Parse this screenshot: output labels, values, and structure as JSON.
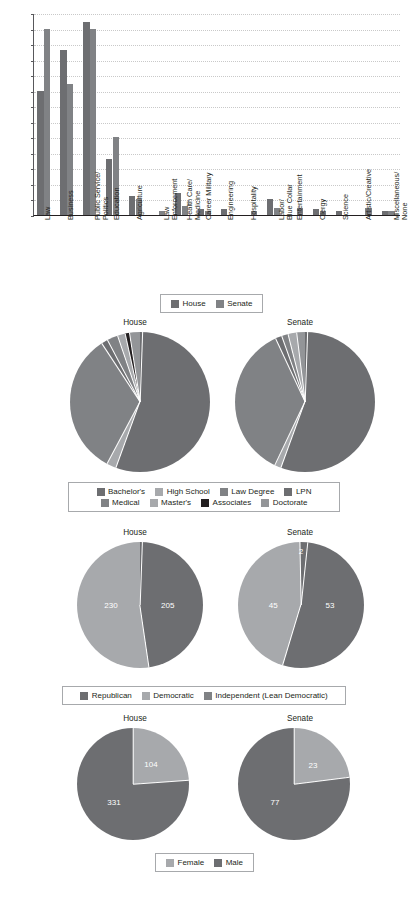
{
  "page": {
    "title_partial": "",
    "background": "#ffffff"
  },
  "colors": {
    "house": "#6d6e71",
    "senate": "#808285",
    "bachelors": "#6d6e71",
    "high_school": "#a7a9ac",
    "law_degree": "#808285",
    "lpn": "#6d6e71",
    "medical": "#808285",
    "masters": "#a7a9ac",
    "associates": "#231f20",
    "doctorate": "#939598",
    "republican": "#6d6e71",
    "democratic": "#a7a9ac",
    "independent": "#808285",
    "female": "#a7a9ac",
    "male": "#6d6e71",
    "axis": "#231f20",
    "grid": "#c9c9c9",
    "legend_border": "#a7a9ac"
  },
  "chart_data": [
    {
      "id": "occupation-bar",
      "type": "bar",
      "title": "",
      "xlabel": "",
      "ylabel": "",
      "ylim": [
        0,
        65
      ],
      "ytick_labels": [
        "65%",
        "60%",
        "55%",
        "50%",
        "45%",
        "40%",
        "35%",
        "30%",
        "25%",
        "20%",
        "15%",
        "10%",
        "5%",
        "0%"
      ],
      "ytick_values": [
        65,
        60,
        55,
        50,
        45,
        40,
        35,
        30,
        25,
        20,
        15,
        10,
        5,
        0
      ],
      "grid": true,
      "legend_position": "bottom",
      "categories": [
        "Law",
        "Business",
        "Public Service/ Politics",
        "Education",
        "Agriculture",
        "Law Enforcement",
        "Health Care/ Medicine",
        "Career Military",
        "Engineering",
        "Hospitality",
        "Labor/ Blue Collar",
        "Entertainment",
        "Clergy",
        "Science",
        "Artistic/Creative",
        "Miscellaneous/ None"
      ],
      "category_lines": [
        [
          "Law"
        ],
        [
          "Business"
        ],
        [
          "Public Service/",
          "Politics"
        ],
        [
          "Education"
        ],
        [
          "Agriculture"
        ],
        [
          "Law",
          "Enforcement"
        ],
        [
          "Health Care/",
          "Medicine"
        ],
        [
          "Career Military"
        ],
        [
          "Engineering"
        ],
        [
          "Hospitality"
        ],
        [
          "Labor/",
          "Blue Collar"
        ],
        [
          "Entertainment"
        ],
        [
          "Clergy"
        ],
        [
          "Science"
        ],
        [
          "Artistic/Creative"
        ],
        [
          "Miscellaneous/",
          "None"
        ]
      ],
      "series": [
        {
          "name": "House",
          "values": [
            40,
            53,
            62,
            18,
            6,
            0,
            7,
            2,
            2,
            0,
            5.3,
            0,
            2,
            1.3,
            0,
            1.2
          ]
        },
        {
          "name": "Senate",
          "values": [
            60,
            42,
            60,
            25,
            5,
            1.2,
            3,
            1.2,
            0,
            1.2,
            2.3,
            2.2,
            1.2,
            0,
            2.2,
            1.2
          ]
        }
      ]
    },
    {
      "id": "education-house",
      "type": "pie",
      "title": "House",
      "categories": [
        "Bachelor's",
        "High School",
        "Law Degree",
        "LPN",
        "Medical",
        "Master's",
        "Associates",
        "Doctorate"
      ],
      "values": [
        55,
        2.2,
        33,
        1.5,
        2.5,
        1.8,
        1.0,
        3.0
      ],
      "legend_position": "bottom"
    },
    {
      "id": "education-senate",
      "type": "pie",
      "title": "Senate",
      "categories": [
        "Bachelor's",
        "High School",
        "Law Degree",
        "LPN",
        "Medical",
        "Master's",
        "Associates",
        "Doctorate"
      ],
      "values": [
        55,
        1.5,
        36,
        1.5,
        1.5,
        2.0,
        0,
        2.5
      ],
      "legend_position": "bottom"
    },
    {
      "id": "party-house",
      "type": "pie",
      "title": "House",
      "categories": [
        "Republican",
        "Democratic",
        "Independent (Lean Democratic)"
      ],
      "values": [
        205,
        230,
        0
      ],
      "data_labels": [
        "205",
        "230"
      ],
      "legend_position": "bottom"
    },
    {
      "id": "party-senate",
      "type": "pie",
      "title": "Senate",
      "categories": [
        "Republican",
        "Democratic",
        "Independent (Lean Democratic)"
      ],
      "values": [
        53,
        45,
        2
      ],
      "data_labels": [
        "53",
        "45",
        "2"
      ],
      "legend_position": "bottom"
    },
    {
      "id": "gender-house",
      "type": "pie",
      "title": "House",
      "categories": [
        "Female",
        "Male"
      ],
      "values": [
        104,
        331
      ],
      "data_labels": [
        "104",
        "331"
      ],
      "legend_position": "bottom"
    },
    {
      "id": "gender-senate",
      "type": "pie",
      "title": "Senate",
      "categories": [
        "Female",
        "Male"
      ],
      "values": [
        23,
        77
      ],
      "data_labels": [
        "23",
        "77"
      ],
      "legend_position": "bottom"
    }
  ],
  "legends": {
    "chamber": {
      "items": [
        {
          "label": "House",
          "color": "#6d6e71"
        },
        {
          "label": "Senate",
          "color": "#808285"
        }
      ]
    },
    "education": {
      "items": [
        {
          "label": "Bachelor's",
          "color": "#6d6e71"
        },
        {
          "label": "High School",
          "color": "#a7a9ac"
        },
        {
          "label": "Law Degree",
          "color": "#808285"
        },
        {
          "label": "LPN",
          "color": "#6d6e71"
        },
        {
          "label": "Medical",
          "color": "#808285"
        },
        {
          "label": "Master's",
          "color": "#a7a9ac"
        },
        {
          "label": "Associates",
          "color": "#231f20"
        },
        {
          "label": "Doctorate",
          "color": "#939598"
        }
      ]
    },
    "party": {
      "items": [
        {
          "label": "Republican",
          "color": "#6d6e71"
        },
        {
          "label": "Democratic",
          "color": "#a7a9ac"
        },
        {
          "label": "Independent (Lean Democratic)",
          "color": "#808285"
        }
      ]
    },
    "gender": {
      "items": [
        {
          "label": "Female",
          "color": "#a7a9ac"
        },
        {
          "label": "Male",
          "color": "#6d6e71"
        }
      ]
    }
  },
  "sections": {
    "education": {
      "house_title": "House",
      "senate_title": "Senate"
    },
    "party": {
      "house_title": "House",
      "senate_title": "Senate"
    },
    "gender": {
      "house_title": "House",
      "senate_title": "Senate"
    }
  }
}
